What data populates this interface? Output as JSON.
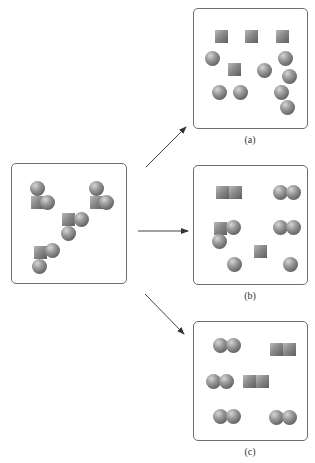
{
  "diagram": {
    "reactant_box": {
      "label": "",
      "molecules": [
        {
          "type": "square+2spheres",
          "square": [
            31,
            196
          ],
          "spheres": [
            [
              30,
              181
            ],
            [
              40,
              195
            ]
          ]
        },
        {
          "type": "square+2spheres",
          "square": [
            90,
            196
          ],
          "spheres": [
            [
              89,
              181
            ],
            [
              99,
              195
            ]
          ]
        },
        {
          "type": "square+2spheres",
          "square": [
            62,
            213
          ],
          "spheres": [
            [
              74,
              212
            ],
            [
              61,
              226
            ]
          ]
        },
        {
          "type": "square+2spheres",
          "square": [
            34,
            246
          ],
          "spheres": [
            [
              45,
              243
            ],
            [
              32,
              259
            ]
          ]
        }
      ]
    },
    "products": [
      {
        "label": "(a)",
        "squares": [
          [
            215,
            30
          ],
          [
            245,
            30
          ],
          [
            276,
            30
          ],
          [
            228,
            63
          ]
        ],
        "spheres": [
          [
            205,
            51
          ],
          [
            278,
            51
          ],
          [
            257,
            63
          ],
          [
            282,
            69
          ],
          [
            212,
            85
          ],
          [
            233,
            85
          ],
          [
            274,
            85
          ],
          [
            280,
            100
          ]
        ]
      },
      {
        "label": "(b)",
        "squares": [
          [
            216,
            186
          ],
          [
            229,
            186
          ],
          [
            214,
            222
          ],
          [
            254,
            245
          ]
        ],
        "spheres": [
          [
            273,
            185
          ],
          [
            286,
            185
          ],
          [
            226,
            220
          ],
          [
            212,
            234
          ],
          [
            273,
            220
          ],
          [
            286,
            220
          ],
          [
            227,
            257
          ],
          [
            283,
            257
          ]
        ]
      },
      {
        "label": "(c)",
        "squares": [
          [
            270,
            343
          ],
          [
            283,
            343
          ],
          [
            243,
            375
          ],
          [
            256,
            375
          ]
        ],
        "spheres": [
          [
            213,
            338
          ],
          [
            226,
            338
          ],
          [
            206,
            374
          ],
          [
            219,
            374
          ],
          [
            213,
            409
          ],
          [
            226,
            409
          ],
          [
            269,
            410
          ],
          [
            282,
            410
          ]
        ]
      }
    ],
    "arrows": [
      {
        "from": [
          146,
          167
        ],
        "to": [
          186,
          127
        ],
        "target": "(a)"
      },
      {
        "from": [
          138,
          231
        ],
        "to": [
          188,
          231
        ],
        "target": "(b)"
      },
      {
        "from": [
          145,
          294
        ],
        "to": [
          184,
          334
        ],
        "target": "(c)"
      }
    ],
    "colors": {
      "frame": "#6e6e6e",
      "arrow": "#333333",
      "sphere": "#7a7a7a",
      "square": "#8a8a8a"
    }
  }
}
